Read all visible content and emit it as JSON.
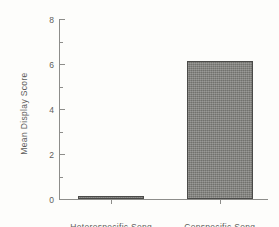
{
  "chart_data": {
    "type": "bar",
    "title": "",
    "xlabel": "",
    "ylabel": "Mean Display Score",
    "categories": [
      "Heterospecific  Song",
      "Conspecific  Song"
    ],
    "values": [
      0.1,
      6.15
    ],
    "ylim": [
      0,
      8
    ],
    "ytick_labels": [
      "0",
      "2",
      "4",
      "6",
      "8"
    ],
    "ytick_values": [
      0,
      2,
      4,
      6,
      8
    ],
    "yminor_values": [
      1,
      3,
      5,
      7
    ],
    "grid": false,
    "legend": null,
    "bar_color": "#7e7e7a",
    "bar_edge_color": "#4b4b49",
    "axis_color": "#8d8d8a",
    "text_color": "#5e5e5c",
    "background_color": "#fdfdfb"
  }
}
